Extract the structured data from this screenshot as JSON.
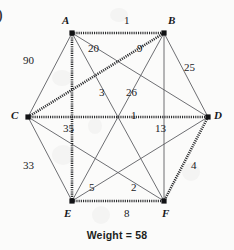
{
  "figure": {
    "corner_mark": ")",
    "caption": "Weight = 58"
  },
  "chart_data": {
    "type": "diagram",
    "title": "Weight = 58",
    "graph_kind": "weighted-complete-graph",
    "layout": "hexagon",
    "nodes": [
      {
        "id": "A",
        "label": "A",
        "x": 72,
        "y": 33,
        "label_x": 62,
        "label_y": 15
      },
      {
        "id": "B",
        "label": "B",
        "x": 164,
        "y": 33,
        "label_x": 168,
        "label_y": 15
      },
      {
        "id": "C",
        "label": "C",
        "x": 28,
        "y": 117,
        "label_x": 11,
        "label_y": 110
      },
      {
        "id": "D",
        "label": "D",
        "x": 208,
        "y": 117,
        "label_x": 214,
        "label_y": 110
      },
      {
        "id": "E",
        "label": "E",
        "x": 72,
        "y": 201,
        "label_x": 64,
        "label_y": 208
      },
      {
        "id": "F",
        "label": "F",
        "x": 164,
        "y": 201,
        "label_x": 162,
        "label_y": 208
      }
    ],
    "edges": [
      {
        "from": "A",
        "to": "B",
        "weight": 1,
        "label_x": 124,
        "label_y": 15,
        "highlighted": true
      },
      {
        "from": "A",
        "to": "C",
        "weight": 90,
        "label_x": 23,
        "label_y": 55,
        "highlighted": false
      },
      {
        "from": "A",
        "to": "D",
        "weight": 20,
        "label_x": 88,
        "label_y": 43,
        "highlighted": false
      },
      {
        "from": "A",
        "to": "E",
        "weight": 35,
        "label_x": 63,
        "label_y": 123,
        "highlighted": true
      },
      {
        "from": "A",
        "to": "F",
        "weight": 3,
        "label_x": 99,
        "label_y": 87,
        "highlighted": false
      },
      {
        "from": "B",
        "to": "C",
        "weight": 9,
        "label_x": 137,
        "label_y": 43,
        "highlighted": true
      },
      {
        "from": "B",
        "to": "D",
        "weight": 25,
        "label_x": 184,
        "label_y": 62,
        "highlighted": false
      },
      {
        "from": "B",
        "to": "E",
        "weight": 26,
        "label_x": 126,
        "label_y": 87,
        "highlighted": false
      },
      {
        "from": "B",
        "to": "F",
        "weight": 13,
        "label_x": 155,
        "label_y": 123,
        "highlighted": false
      },
      {
        "from": "C",
        "to": "D",
        "weight": 1,
        "label_x": 131,
        "label_y": 110,
        "highlighted": true
      },
      {
        "from": "C",
        "to": "E",
        "weight": 33,
        "label_x": 23,
        "label_y": 160,
        "highlighted": false
      },
      {
        "from": "C",
        "to": "F",
        "weight": 2,
        "label_x": 131,
        "label_y": 182,
        "highlighted": false
      },
      {
        "from": "D",
        "to": "E",
        "weight": 5,
        "label_x": 89,
        "label_y": 182,
        "highlighted": false
      },
      {
        "from": "D",
        "to": "F",
        "weight": 4,
        "label_x": 191,
        "label_y": 160,
        "highlighted": true
      },
      {
        "from": "E",
        "to": "F",
        "weight": 8,
        "label_x": 124,
        "label_y": 208,
        "highlighted": true
      }
    ],
    "total_weight": 58,
    "highlighted_edges": [
      "A-B",
      "A-E",
      "B-C",
      "C-D",
      "D-F",
      "E-F"
    ],
    "ylabel": "",
    "xlabel": "",
    "legend": []
  }
}
